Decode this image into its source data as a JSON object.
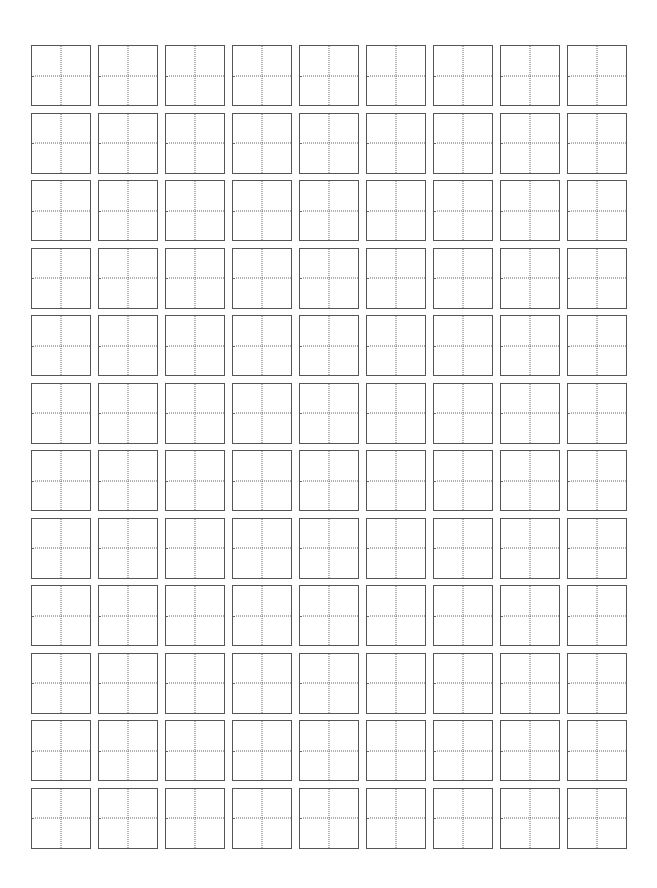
{
  "worksheet": {
    "type": "tian-zi-ge practice grid",
    "rows": 12,
    "columns": 9,
    "border_color": "#555555",
    "guide_color": "#666666",
    "cells_content": ""
  }
}
